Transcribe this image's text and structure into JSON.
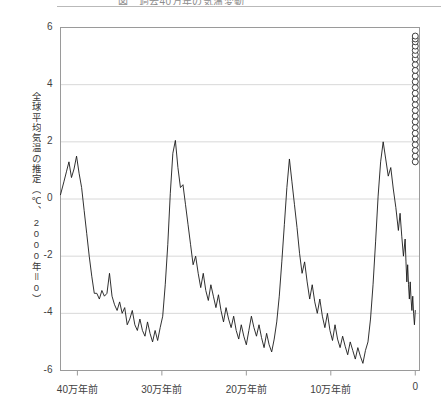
{
  "page": {
    "title_cutoff": "図　過去40万年の気温変動",
    "background_color": "#ffffff"
  },
  "chart_data": {
    "type": "line",
    "title": "",
    "xlabel": "",
    "ylabel": "全球平均気温の推定（℃、2000年＝0）",
    "xlim": [
      -420000,
      5000
    ],
    "ylim": [
      -6,
      6
    ],
    "grid": true,
    "grid_color": "#d8d8d8",
    "legend": "none",
    "line_color": "#1a1a1a",
    "marker_color": "#2a2a2a",
    "axis_color": "#9a9a9a",
    "x_ticks": [
      {
        "value": -400000,
        "label": "40万年前"
      },
      {
        "value": -300000,
        "label": "30万年前"
      },
      {
        "value": -200000,
        "label": "20万年前"
      },
      {
        "value": -100000,
        "label": "10万年前"
      },
      {
        "value": 0,
        "label": "0"
      }
    ],
    "y_ticks": [
      {
        "value": 6,
        "label": "6"
      },
      {
        "value": 4,
        "label": "4"
      },
      {
        "value": 2,
        "label": "2"
      },
      {
        "value": 0,
        "label": "0"
      },
      {
        "value": -2,
        "label": "-2"
      },
      {
        "value": -4,
        "label": "-4"
      },
      {
        "value": -6,
        "label": "-6"
      }
    ],
    "series": [
      {
        "name": "推定気温",
        "style": "line",
        "x": [
          -420000,
          -416000,
          -413000,
          -410000,
          -407000,
          -404000,
          -401000,
          -398000,
          -395000,
          -392000,
          -389000,
          -386000,
          -383000,
          -380000,
          -377000,
          -374000,
          -371000,
          -368000,
          -365000,
          -362000,
          -359000,
          -356000,
          -353000,
          -350000,
          -347000,
          -344000,
          -341000,
          -338000,
          -335000,
          -332000,
          -329000,
          -326000,
          -323000,
          -320000,
          -317000,
          -314000,
          -311000,
          -308000,
          -305000,
          -302000,
          -299000,
          -296000,
          -293000,
          -290000,
          -287000,
          -284000,
          -281000,
          -278000,
          -275000,
          -272000,
          -269000,
          -266000,
          -263000,
          -260000,
          -257000,
          -254000,
          -251000,
          -248000,
          -245000,
          -242000,
          -239000,
          -236000,
          -233000,
          -230000,
          -227000,
          -224000,
          -221000,
          -218000,
          -215000,
          -212000,
          -209000,
          -206000,
          -203000,
          -200000,
          -197000,
          -194000,
          -191000,
          -188000,
          -185000,
          -182000,
          -179000,
          -176000,
          -173000,
          -170000,
          -167000,
          -164000,
          -161000,
          -158000,
          -155000,
          -152000,
          -149000,
          -146000,
          -143000,
          -140000,
          -137000,
          -134000,
          -131000,
          -128000,
          -125000,
          -122000,
          -119000,
          -116000,
          -113000,
          -110000,
          -107000,
          -104000,
          -101000,
          -98000,
          -95000,
          -92000,
          -89000,
          -86000,
          -83000,
          -80000,
          -77000,
          -74000,
          -71000,
          -68000,
          -65000,
          -62000,
          -59000,
          -56000,
          -53000,
          -50000,
          -47000,
          -44000,
          -41000,
          -38000,
          -35000,
          -32000,
          -29000,
          -26000,
          -23000,
          -20000,
          -18000,
          -16000,
          -14000,
          -12000,
          -11000,
          -10000,
          -9000,
          -8000,
          -7000,
          -6000,
          -5000,
          -4000,
          -3000,
          -2000,
          -1000,
          0
        ],
        "y": [
          0.15,
          0.6,
          0.95,
          1.3,
          0.75,
          1.05,
          1.5,
          0.9,
          0.4,
          -0.4,
          -1.2,
          -2.0,
          -2.7,
          -3.3,
          -3.3,
          -3.5,
          -3.2,
          -3.4,
          -3.3,
          -2.6,
          -3.4,
          -3.7,
          -3.9,
          -3.6,
          -4.0,
          -3.8,
          -4.4,
          -4.2,
          -3.9,
          -4.4,
          -4.6,
          -4.2,
          -4.6,
          -4.8,
          -4.3,
          -4.7,
          -5.0,
          -4.6,
          -4.95,
          -4.5,
          -4.1,
          -3.0,
          -1.6,
          0.2,
          1.6,
          2.05,
          1.1,
          0.4,
          0.5,
          -0.2,
          -0.9,
          -1.6,
          -2.3,
          -2.0,
          -2.6,
          -3.1,
          -2.6,
          -3.2,
          -3.55,
          -3.0,
          -3.4,
          -3.8,
          -3.35,
          -3.9,
          -4.3,
          -3.8,
          -4.2,
          -4.5,
          -4.1,
          -4.6,
          -4.9,
          -4.4,
          -4.8,
          -5.1,
          -4.6,
          -4.1,
          -4.5,
          -4.8,
          -4.4,
          -4.85,
          -5.2,
          -4.7,
          -5.1,
          -5.35,
          -4.9,
          -4.3,
          -3.4,
          -2.2,
          -0.9,
          0.4,
          1.4,
          0.6,
          -0.2,
          -1.0,
          -1.9,
          -2.6,
          -2.2,
          -2.9,
          -3.5,
          -3.0,
          -3.6,
          -4.0,
          -3.5,
          -4.1,
          -4.5,
          -4.0,
          -4.6,
          -4.95,
          -4.4,
          -4.9,
          -5.2,
          -4.8,
          -5.15,
          -5.45,
          -5.0,
          -5.3,
          -5.6,
          -5.2,
          -5.5,
          -5.75,
          -5.3,
          -5.0,
          -4.2,
          -3.0,
          -1.5,
          0.1,
          1.3,
          2.0,
          1.4,
          0.8,
          1.1,
          0.35,
          -0.3,
          -1.1,
          -0.5,
          -1.3,
          -2.0,
          -1.4,
          -2.2,
          -2.9,
          -2.3,
          -3.0,
          -3.5,
          -2.9,
          -3.5,
          -3.9,
          -3.4,
          -4.0,
          -4.4,
          -3.9
        ],
        "note": "左から右へ、過去42万年前から現在までの氷期・間氷期サイクル（鋸歯状）"
      },
      {
        "name": "将来予測（現在＝0年）",
        "style": "open-circles",
        "x": [
          0,
          0,
          0,
          0,
          0,
          0,
          0,
          0,
          0,
          0,
          0,
          0,
          0,
          0,
          0,
          0,
          0,
          0,
          0,
          0,
          0,
          0,
          0,
          0,
          0
        ],
        "y": [
          1.3,
          1.5,
          1.7,
          1.9,
          2.1,
          2.3,
          2.5,
          2.7,
          2.9,
          3.1,
          3.3,
          3.5,
          3.7,
          3.9,
          4.1,
          4.3,
          4.5,
          4.7,
          4.9,
          5.05,
          5.2,
          5.35,
          5.5,
          5.6,
          5.7
        ],
        "note": "右端0の位置に縦に並ぶ白抜きの丸印"
      }
    ]
  }
}
